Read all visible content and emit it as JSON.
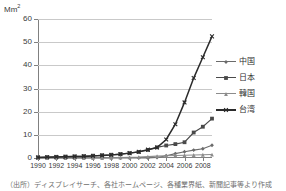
{
  "chart_data": {
    "type": "line",
    "title": "",
    "ylabel": "Mm²",
    "ylabel_html": "Mm<sup>2</sup>",
    "xlabel": "",
    "ylim": [
      0,
      60
    ],
    "ytick_labels": [
      "0",
      "10",
      "20",
      "30",
      "40",
      "50",
      "60"
    ],
    "yticks": [
      0,
      10,
      20,
      30,
      40,
      50,
      60
    ],
    "grid": "horizontal",
    "legend_position": "right",
    "x": [
      1990,
      1991,
      1992,
      1993,
      1994,
      1995,
      1996,
      1997,
      1998,
      1999,
      2000,
      2001,
      2002,
      2003,
      2004,
      2005,
      2006,
      2007,
      2008,
      2009
    ],
    "xtick_labels": [
      "1990",
      "1992",
      "1994",
      "1996",
      "1998",
      "2000",
      "2002",
      "2004",
      "2006",
      "2008"
    ],
    "xticks": [
      1990,
      1992,
      1994,
      1996,
      1998,
      2000,
      2002,
      2004,
      2006,
      2008
    ],
    "xlim": [
      1990,
      2009
    ],
    "series": [
      {
        "name": "中国",
        "name_en": "China",
        "marker": "diamond",
        "color": "#6b6b6b",
        "values": [
          0,
          0,
          0,
          0,
          0,
          0,
          0,
          0,
          0,
          0,
          0,
          0,
          0,
          0.2,
          1.0,
          1.9,
          2.7,
          3.4,
          4.0,
          5.5
        ]
      },
      {
        "name": "日本",
        "name_en": "Japan",
        "marker": "square",
        "color": "#4a4a4a",
        "values": [
          0.3,
          0.4,
          0.5,
          0.6,
          0.7,
          0.8,
          1.0,
          1.2,
          1.4,
          1.7,
          2.1,
          2.6,
          3.5,
          4.6,
          5.4,
          6.0,
          6.8,
          11.0,
          13.5,
          17.0
        ]
      },
      {
        "name": "韓国",
        "name_en": "Korea",
        "marker": "triangle",
        "color": "#8c8c8c",
        "values": [
          0,
          0,
          0,
          0,
          0,
          0,
          0,
          0,
          0.1,
          0.2,
          0.3,
          0.4,
          0.6,
          0.8,
          1.0,
          1.1,
          1.2,
          1.3,
          1.4,
          1.5
        ]
      },
      {
        "name": "台湾",
        "name_en": "Taiwan",
        "marker": "cross",
        "color": "#2b2b2b",
        "values": [
          0.2,
          0.3,
          0.4,
          0.5,
          0.6,
          0.7,
          0.9,
          1.1,
          1.3,
          1.6,
          2.1,
          2.7,
          3.6,
          4.5,
          8.0,
          14.6,
          24.0,
          34.5,
          43.5,
          52.5
        ]
      }
    ]
  },
  "legend": {
    "items": [
      {
        "label": "中国"
      },
      {
        "label": "日本"
      },
      {
        "label": "韓国"
      },
      {
        "label": "台湾"
      }
    ]
  },
  "caption": {
    "text": "（出所）ディスプレイサーチ、各社ホームページ、各種業界紙、新聞記事等より作成"
  },
  "colors": {
    "axis": "#808080",
    "grid": "#c9c9c9",
    "text": "#3a3a3a",
    "background": "#ffffff"
  }
}
